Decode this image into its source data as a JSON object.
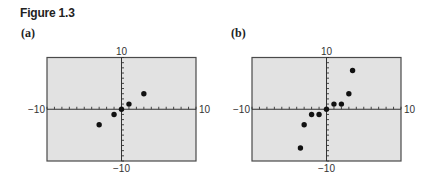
{
  "figure": {
    "title": "Figure 1.3"
  },
  "colors": {
    "plot_background": "#e2e2e2",
    "frame": "#4a4a4a",
    "axis": "#333333",
    "point": "#111111",
    "text": "#222222"
  },
  "chart_data": [
    {
      "type": "scatter",
      "panel_label": "(a)",
      "title": "",
      "xlabel": "",
      "ylabel": "",
      "xlim": [
        -10,
        10
      ],
      "ylim": [
        -10,
        10
      ],
      "xtick_step": 1,
      "ytick_step": 1,
      "grid": false,
      "tick_labels": {
        "xmin": "−10",
        "xmax": "10",
        "ymin": "−10",
        "ymax": "10"
      },
      "points": [
        {
          "x": -3,
          "y": -3
        },
        {
          "x": -1,
          "y": -1
        },
        {
          "x": 0,
          "y": 0
        },
        {
          "x": 1,
          "y": 1
        },
        {
          "x": 3,
          "y": 3
        }
      ]
    },
    {
      "type": "scatter",
      "panel_label": "(b)",
      "title": "",
      "xlabel": "",
      "ylabel": "",
      "xlim": [
        -10,
        10
      ],
      "ylim": [
        -10,
        10
      ],
      "xtick_step": 1,
      "ytick_step": 1,
      "grid": false,
      "tick_labels": {
        "xmin": "−10",
        "xmax": "10",
        "ymin": "−10",
        "ymax": "10"
      },
      "points": [
        {
          "x": -3.5,
          "y": -7.5
        },
        {
          "x": -3,
          "y": -3
        },
        {
          "x": -2,
          "y": -1
        },
        {
          "x": -1,
          "y": -1
        },
        {
          "x": 0,
          "y": 0
        },
        {
          "x": 1,
          "y": 1
        },
        {
          "x": 2,
          "y": 1
        },
        {
          "x": 3,
          "y": 3
        },
        {
          "x": 3.5,
          "y": 7.5
        }
      ]
    }
  ]
}
